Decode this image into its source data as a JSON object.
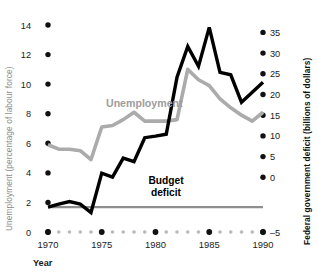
{
  "chart_data": {
    "type": "line",
    "title": "",
    "xlabel": "Year",
    "x": [
      1970,
      1971,
      1972,
      1973,
      1974,
      1975,
      1976,
      1977,
      1978,
      1979,
      1980,
      1981,
      1982,
      1983,
      1984,
      1985,
      1986,
      1987,
      1988,
      1989,
      1990
    ],
    "xlim": [
      1970,
      1990
    ],
    "xticks": [
      1970,
      1975,
      1980,
      1985,
      1990
    ],
    "xtick_labels": [
      "1970",
      "1975",
      "1980",
      "1985",
      "1990"
    ],
    "grid": false,
    "legend": "inline-labels",
    "axes": [
      {
        "id": "left",
        "label": "Unemployment (percentage of labour force)",
        "ylim": [
          0,
          14
        ],
        "yticks": [
          0,
          2,
          4,
          6,
          8,
          10,
          12,
          14
        ],
        "ytick_labels": [
          "0",
          "2",
          "4",
          "6",
          "8",
          "10",
          "12",
          "14"
        ]
      },
      {
        "id": "right",
        "label": "Federal government deficit (billions of dollars)",
        "ylim": [
          -5,
          35
        ],
        "yticks": [
          -5,
          0,
          5,
          10,
          15,
          20,
          25,
          30,
          35
        ],
        "ytick_labels": [
          "–5",
          "0",
          "5",
          "10",
          "15",
          "20",
          "25",
          "30",
          "35"
        ]
      }
    ],
    "series": [
      {
        "name": "Unemployment",
        "axis": "left",
        "color": "#ababab",
        "label_text": "Unemployment",
        "units": "percent of labour force",
        "values": [
          5.9,
          5.6,
          5.6,
          5.5,
          4.9,
          7.1,
          7.2,
          7.6,
          8.1,
          7.5,
          7.5,
          7.5,
          7.6,
          11.0,
          10.3,
          9.9,
          9.0,
          8.4,
          7.9,
          7.5,
          8.1
        ]
      },
      {
        "name": "Budget deficit",
        "axis": "right",
        "color": "#000000",
        "label_text": "Budget deficit",
        "units": "billions of dollars",
        "values": [
          0.0,
          0.6,
          1.1,
          0.6,
          -1.1,
          6.8,
          6.0,
          9.8,
          9.1,
          13.9,
          14.2,
          14.6,
          26.0,
          32.2,
          28.2,
          36.0,
          27.0,
          26.5,
          21.0,
          23.0,
          25.0
        ]
      }
    ],
    "reference_lines": [
      {
        "name": "zero-deficit",
        "axis": "right",
        "value": 0,
        "color": "#8e8e8e"
      }
    ]
  },
  "labels": {
    "unemployment_series": "Unemployment",
    "deficit_series_line1": "Budget",
    "deficit_series_line2": "deficit",
    "left_axis_title": "Unemployment (percentage of labour force)",
    "right_axis_title": "Federal government deficit (billions of dollars)",
    "x_axis_title": "Year"
  }
}
